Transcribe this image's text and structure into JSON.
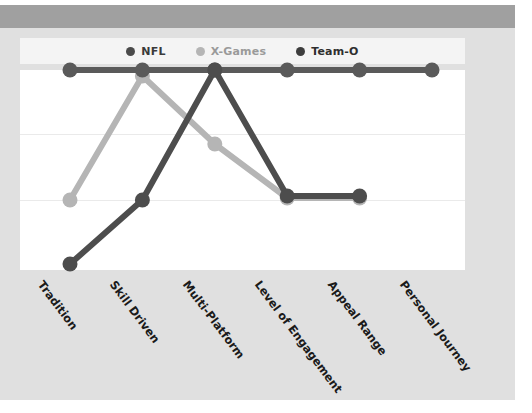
{
  "chart_data": {
    "type": "line",
    "title": "",
    "xlabel": "",
    "ylabel": "",
    "categories": [
      "Tradition",
      "Skill Driven",
      "Multi-Platform",
      "Level of Engagement",
      "Appeal Range",
      "Personal Journey"
    ],
    "ylim": [
      0,
      1
    ],
    "grid": true,
    "gridlines_y": [
      0.33,
      0.66
    ],
    "legend_position": "top-center",
    "series": [
      {
        "name": "NFL",
        "color": "#5a5a5a",
        "values": [
          1.0,
          1.0,
          1.0,
          1.0,
          1.0,
          1.0
        ]
      },
      {
        "name": "X-Games",
        "color": "#b5b5b5",
        "values": [
          0.35,
          0.97,
          0.63,
          0.36,
          0.36,
          null
        ]
      },
      {
        "name": "Team-O",
        "color": "#4d4d4d",
        "values": [
          0.03,
          0.35,
          1.0,
          0.37,
          0.37,
          null
        ]
      }
    ]
  },
  "legend": {
    "items": [
      {
        "label": "NFL",
        "color": "#4a4a4a"
      },
      {
        "label": "X-Games",
        "color": "#b5b5b5"
      },
      {
        "label": "Team-O",
        "color": "#3d3d3d"
      }
    ]
  },
  "axis": {
    "categories": [
      "Tradition",
      "Skill Driven",
      "Multi-Platform",
      "Level of Engagement",
      "Appeal Range",
      "Personal Journey"
    ]
  },
  "colors": {
    "figure_background": "#e0e0e0",
    "plot_background": "#ffffff",
    "top_band": "#a0a0a0",
    "legend_background": "#f4f4f4",
    "gridline": "#eaeaea"
  }
}
